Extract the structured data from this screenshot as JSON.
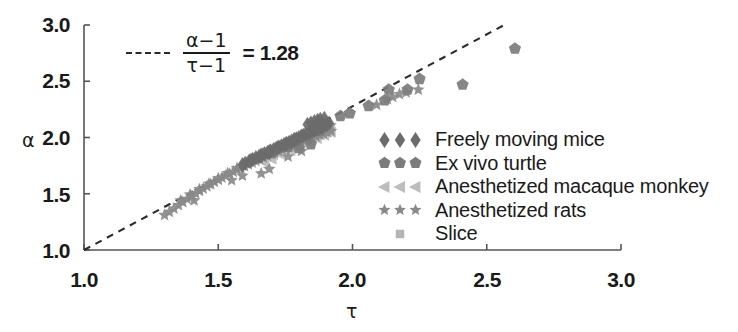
{
  "chart_data": {
    "type": "scatter",
    "title": "",
    "xlabel": "τ",
    "ylabel": "α",
    "xlim": [
      1.0,
      3.0
    ],
    "ylim": [
      1.0,
      3.0
    ],
    "xticks": [
      "1.0",
      "1.5",
      "2.0",
      "2.5",
      "3.0"
    ],
    "yticks": [
      "1.0",
      "1.5",
      "2.0",
      "2.5",
      "3.0"
    ],
    "xtick_values": [
      1.0,
      1.5,
      2.0,
      2.5,
      3.0
    ],
    "ytick_values": [
      1.0,
      1.5,
      2.0,
      2.5,
      3.0
    ],
    "grid": false,
    "legend_position": "center-right",
    "annotation": {
      "equation_numerator": "α−1",
      "equation_denominator": "τ−1",
      "equation_equals": "= 1.28",
      "slope": 1.28,
      "line_style": "dashed",
      "line_from": [
        1.0,
        1.0
      ],
      "line_to": [
        2.565,
        3.0
      ]
    },
    "series": [
      {
        "name": "Freely moving mice",
        "marker": "diamond",
        "color": "#6b6b6b",
        "points": [
          [
            1.6,
            1.77
          ],
          [
            1.615,
            1.79
          ],
          [
            1.628,
            1.805
          ],
          [
            1.64,
            1.82
          ],
          [
            1.652,
            1.832
          ],
          [
            1.663,
            1.845
          ],
          [
            1.672,
            1.856
          ],
          [
            1.684,
            1.868
          ],
          [
            1.695,
            1.88
          ],
          [
            1.706,
            1.892
          ],
          [
            1.716,
            1.903
          ],
          [
            1.726,
            1.915
          ],
          [
            1.735,
            1.925
          ],
          [
            1.745,
            1.936
          ],
          [
            1.755,
            1.947
          ],
          [
            1.764,
            1.957
          ],
          [
            1.773,
            1.967
          ],
          [
            1.782,
            1.978
          ],
          [
            1.791,
            1.988
          ],
          [
            1.8,
            1.999
          ],
          [
            1.809,
            2.009
          ],
          [
            1.818,
            2.019
          ],
          [
            1.826,
            2.029
          ],
          [
            1.835,
            2.039
          ],
          [
            1.843,
            2.048
          ],
          [
            1.852,
            2.058
          ],
          [
            1.86,
            2.068
          ],
          [
            1.868,
            2.077
          ],
          [
            1.876,
            2.086
          ],
          [
            1.884,
            2.095
          ],
          [
            1.891,
            2.104
          ],
          [
            1.899,
            2.112
          ],
          [
            1.906,
            2.12
          ],
          [
            1.913,
            2.128
          ],
          [
            1.59,
            1.758
          ],
          [
            1.622,
            1.796
          ],
          [
            1.658,
            1.838
          ],
          [
            1.69,
            1.874
          ],
          [
            1.722,
            1.91
          ],
          [
            1.752,
            1.943
          ],
          [
            1.784,
            1.98
          ],
          [
            1.812,
            2.012
          ],
          [
            1.84,
            2.044
          ],
          [
            1.866,
            2.074
          ],
          [
            1.888,
            2.098
          ],
          [
            1.905,
            2.118
          ],
          [
            1.87,
            2.152
          ],
          [
            1.88,
            2.16
          ],
          [
            1.895,
            2.17
          ],
          [
            1.858,
            2.14
          ],
          [
            1.845,
            2.128
          ],
          [
            1.832,
            2.116
          ]
        ]
      },
      {
        "name": "Ex vivo turtle",
        "marker": "pentagon",
        "color": "#7c7c7c",
        "points": [
          [
            1.8,
            1.905
          ],
          [
            1.845,
            1.94
          ],
          [
            1.955,
            2.19
          ],
          [
            2.06,
            2.28
          ],
          [
            2.12,
            2.33
          ],
          [
            2.135,
            2.425
          ],
          [
            2.205,
            2.425
          ],
          [
            2.25,
            2.52
          ],
          [
            2.41,
            2.47
          ],
          [
            2.605,
            2.79
          ],
          [
            1.7,
            1.862
          ],
          [
            1.76,
            1.918
          ],
          [
            1.878,
            2.06
          ],
          [
            1.99,
            2.215
          ]
        ]
      },
      {
        "name": "Anesthetized macaque monkey",
        "marker": "triangle-left",
        "color": "#bdbdbd",
        "points": [
          [
            1.66,
            1.8
          ],
          [
            1.685,
            1.826
          ],
          [
            1.705,
            1.848
          ],
          [
            1.726,
            1.87
          ],
          [
            1.748,
            1.893
          ],
          [
            1.768,
            1.915
          ],
          [
            1.79,
            1.938
          ],
          [
            1.81,
            1.958
          ],
          [
            1.83,
            1.978
          ],
          [
            1.85,
            1.996
          ],
          [
            1.866,
            2.012
          ],
          [
            1.88,
            2.028
          ],
          [
            1.894,
            2.042
          ],
          [
            1.906,
            2.056
          ],
          [
            1.918,
            2.068
          ],
          [
            1.672,
            1.778
          ],
          [
            1.7,
            1.808
          ],
          [
            1.735,
            1.846
          ],
          [
            1.77,
            1.884
          ],
          [
            1.805,
            1.922
          ],
          [
            1.838,
            1.958
          ],
          [
            1.868,
            1.99
          ],
          [
            1.896,
            2.02
          ],
          [
            1.92,
            2.046
          ]
        ]
      },
      {
        "name": "Anesthetized rats",
        "marker": "star",
        "color": "#8a8a8a",
        "points": [
          [
            1.3,
            1.31
          ],
          [
            1.318,
            1.338
          ],
          [
            1.335,
            1.368
          ],
          [
            1.352,
            1.398
          ],
          [
            1.368,
            1.425
          ],
          [
            1.384,
            1.452
          ],
          [
            1.4,
            1.478
          ],
          [
            1.416,
            1.502
          ],
          [
            1.43,
            1.525
          ],
          [
            1.444,
            1.546
          ],
          [
            1.458,
            1.566
          ],
          [
            1.472,
            1.586
          ],
          [
            1.486,
            1.605
          ],
          [
            1.5,
            1.624
          ],
          [
            1.514,
            1.642
          ],
          [
            1.528,
            1.66
          ],
          [
            1.542,
            1.678
          ],
          [
            1.556,
            1.695
          ],
          [
            1.57,
            1.712
          ],
          [
            1.584,
            1.729
          ],
          [
            1.598,
            1.745
          ],
          [
            1.612,
            1.761
          ],
          [
            1.626,
            1.777
          ],
          [
            1.64,
            1.793
          ],
          [
            1.654,
            1.808
          ],
          [
            1.668,
            1.823
          ],
          [
            1.682,
            1.838
          ],
          [
            1.696,
            1.852
          ],
          [
            1.71,
            1.866
          ],
          [
            1.724,
            1.88
          ],
          [
            1.738,
            1.894
          ],
          [
            1.752,
            1.908
          ],
          [
            1.766,
            1.921
          ],
          [
            1.78,
            1.934
          ],
          [
            1.794,
            1.947
          ],
          [
            1.808,
            1.96
          ],
          [
            1.822,
            1.973
          ],
          [
            1.836,
            1.986
          ],
          [
            1.85,
            1.998
          ],
          [
            1.864,
            2.01
          ],
          [
            1.878,
            2.022
          ],
          [
            1.892,
            2.034
          ],
          [
            1.906,
            2.046
          ],
          [
            1.92,
            2.058
          ],
          [
            1.36,
            1.44
          ],
          [
            1.395,
            1.492
          ],
          [
            1.43,
            1.54
          ],
          [
            1.465,
            1.588
          ],
          [
            1.5,
            1.636
          ],
          [
            1.535,
            1.682
          ],
          [
            1.57,
            1.728
          ],
          [
            1.605,
            1.772
          ],
          [
            1.64,
            1.816
          ],
          [
            1.675,
            1.858
          ],
          [
            1.71,
            1.9
          ],
          [
            1.745,
            1.938
          ],
          [
            1.78,
            1.976
          ],
          [
            1.815,
            2.012
          ],
          [
            1.85,
            2.046
          ],
          [
            1.885,
            2.078
          ],
          [
            1.918,
            2.108
          ],
          [
            1.76,
            1.83
          ],
          [
            1.81,
            1.88
          ],
          [
            1.66,
            1.68
          ],
          [
            1.69,
            1.72
          ],
          [
            2.09,
            2.29
          ],
          [
            2.15,
            2.36
          ],
          [
            2.2,
            2.4
          ],
          [
            2.245,
            2.425
          ],
          [
            2.13,
            2.34
          ],
          [
            2.175,
            2.385
          ],
          [
            1.41,
            1.44
          ],
          [
            1.59,
            1.66
          ],
          [
            1.55,
            1.62
          ]
        ]
      },
      {
        "name": "Slice",
        "marker": "square",
        "color": "#b5b5b5",
        "points": [
          [
            1.79,
            1.945
          ],
          [
            1.818,
            1.978
          ],
          [
            1.845,
            2.008
          ],
          [
            1.87,
            2.036
          ],
          [
            1.892,
            2.06
          ],
          [
            1.91,
            2.082
          ],
          [
            1.755,
            1.908
          ],
          [
            1.72,
            1.872
          ],
          [
            1.868,
            2.105
          ],
          [
            1.884,
            2.122
          ]
        ]
      }
    ]
  },
  "legend": {
    "items": [
      {
        "label": "Freely moving mice",
        "marker": "diamond",
        "color": "#6b6b6b"
      },
      {
        "label": "Ex vivo turtle",
        "marker": "pentagon",
        "color": "#7c7c7c"
      },
      {
        "label": "Anesthetized macaque monkey",
        "marker": "triangle-left",
        "color": "#bdbdbd"
      },
      {
        "label": "Anesthetized rats",
        "marker": "star",
        "color": "#8a8a8a"
      },
      {
        "label": "Slice",
        "marker": "square",
        "color": "#b5b5b5"
      }
    ]
  },
  "axes": {
    "x_title": "τ",
    "y_title": "α",
    "x_tick_labels": [
      "1.0",
      "1.5",
      "2.0",
      "2.5",
      "3.0"
    ],
    "y_tick_labels": [
      "3.0",
      "2.5",
      "2.0",
      "1.5",
      "1.0"
    ]
  },
  "equation": {
    "numerator": "α−1",
    "denominator": "τ−1",
    "rhs": "= 1.28"
  },
  "colors": {
    "axis": "#555555",
    "text": "#1a1a1a",
    "dashed_line": "#2b2b2b"
  }
}
